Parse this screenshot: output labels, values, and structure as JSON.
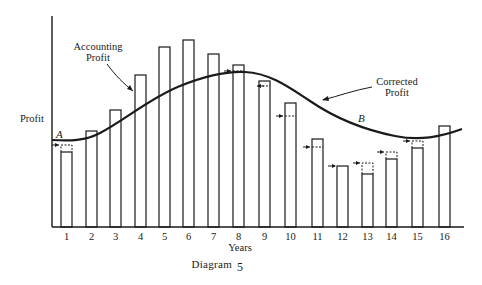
{
  "chart_data": {
    "type": "bar",
    "title": "",
    "caption": "Diagram 5",
    "xlabel": "Years",
    "ylabel": "Profit",
    "categories": [
      "1",
      "2",
      "3",
      "4",
      "5",
      "6",
      "7",
      "8",
      "9",
      "10",
      "11",
      "12",
      "13",
      "14",
      "15",
      "16"
    ],
    "series": [
      {
        "name": "Accounting Profit",
        "type": "bar",
        "values": [
          75,
          96,
          117,
          152,
          180,
          187,
          173,
          162,
          146,
          124,
          88,
          61,
          53,
          68,
          79,
          101
        ]
      },
      {
        "name": "Corrected Profit (dashed adjustments)",
        "type": "bar-adjustment",
        "values": [
          82,
          null,
          null,
          null,
          null,
          null,
          null,
          156,
          141,
          111,
          80,
          null,
          64,
          75,
          86,
          null
        ]
      },
      {
        "name": "Corrected Profit",
        "type": "line",
        "x": [
          0.5,
          1,
          2,
          3,
          4,
          5,
          6,
          7,
          8,
          9,
          10,
          11,
          12,
          13,
          14,
          15,
          16,
          16.5
        ],
        "values": [
          87,
          86,
          90,
          102,
          123,
          145,
          150,
          155,
          155,
          148,
          128,
          110,
          100,
          92,
          90,
          90,
          95,
          97
        ]
      }
    ],
    "annotations": [
      {
        "text": "Accounting Profit",
        "points_to": "bar 4"
      },
      {
        "text": "Corrected Profit",
        "points_to": "curve between years 9 and 10"
      },
      {
        "text": "A",
        "position": "curve start near year 1"
      },
      {
        "text": "B",
        "position": "curve near year 11-12"
      }
    ],
    "ylim": [
      0,
      200
    ],
    "yticks": false,
    "grid": false,
    "legend": "none"
  },
  "labels": {
    "ylabel": "Profit",
    "xlabel": "Years",
    "caption_word": "Diagram",
    "caption_num": "5",
    "accounting_line1": "Accounting",
    "accounting_line2": "Profit",
    "corrected_line1": "Corrected",
    "corrected_line2": "Profit",
    "point_a": "A",
    "point_b": "B"
  },
  "colors": {
    "ink": "#1a1a1a",
    "paper": "#ffffff"
  }
}
